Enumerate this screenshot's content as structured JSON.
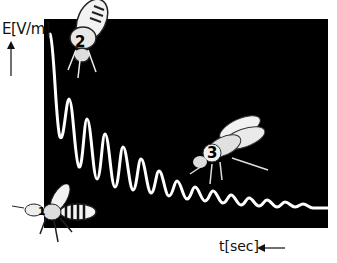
{
  "figure": {
    "y_axis_label": "E[V/m]",
    "x_axis_label": "t[sec]",
    "bees": [
      {
        "number": "1",
        "position": "bottom-left",
        "color": "dark"
      },
      {
        "number": "2",
        "position": "top",
        "color": "light"
      },
      {
        "number": "3",
        "position": "middle-right",
        "color": "light"
      }
    ],
    "panel_color": "#000000",
    "trace_color": "#ffffff"
  }
}
